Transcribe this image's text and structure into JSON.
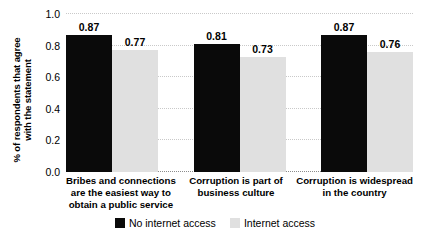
{
  "chart_data": {
    "type": "bar",
    "title": "",
    "xlabel": "",
    "ylabel": "% of respondents that agree\nwith the statement",
    "ylim": [
      0,
      1.0
    ],
    "yticks": [
      "0.0",
      "0.2",
      "0.4",
      "0.6",
      "0.8",
      "1.0"
    ],
    "ytick_values": [
      0.0,
      0.2,
      0.4,
      0.6,
      0.8,
      1.0
    ],
    "grid": true,
    "legend_position": "bottom-center",
    "categories": [
      "Bribes and connections\nare the easiest way to\nobtain a public service",
      "Corruption is part of\nbusiness culture",
      "Corruption is widespread\nin the country"
    ],
    "series": [
      {
        "name": "No internet access",
        "color": "#0a0a0a",
        "values": [
          0.87,
          0.81,
          0.87
        ],
        "labels": [
          "0.87",
          "0.81",
          "0.87"
        ]
      },
      {
        "name": "Internet access",
        "color": "#e0e0e0",
        "values": [
          0.77,
          0.73,
          0.76
        ],
        "labels": [
          "0.77",
          "0.73",
          "0.76"
        ]
      }
    ]
  },
  "legend": {
    "items": [
      {
        "label": "No internet access",
        "color": "#0a0a0a"
      },
      {
        "label": "Internet access",
        "color": "#e0e0e0"
      }
    ]
  }
}
